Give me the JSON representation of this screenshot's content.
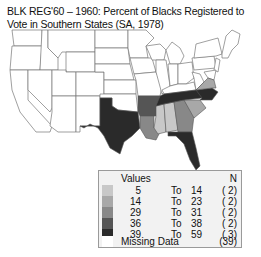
{
  "title": "BLK REG'60 – 1960: Percent of Blacks Registered to Vote in Southern States (SA, 1978)",
  "colors": {
    "class1": "#c8c8c8",
    "class2": "#a8a8a8",
    "class3": "#888888",
    "class4": "#555555",
    "class5": "#2a2a2a",
    "missing": "#ffffff",
    "border": "#777777"
  },
  "legend": {
    "header_values": "Values",
    "header_n": "N",
    "to_label": "To",
    "classes": [
      {
        "low": "5",
        "high": "14",
        "n": "( 2)"
      },
      {
        "low": "14",
        "high": "23",
        "n": "( 2)"
      },
      {
        "low": "29",
        "high": "31",
        "n": "( 2)"
      },
      {
        "low": "36",
        "high": "38",
        "n": "( 2)"
      },
      {
        "low": "39",
        "high": "59",
        "n": "( 3)"
      }
    ],
    "missing_label": "Missing Data",
    "missing_n": "(39)"
  }
}
